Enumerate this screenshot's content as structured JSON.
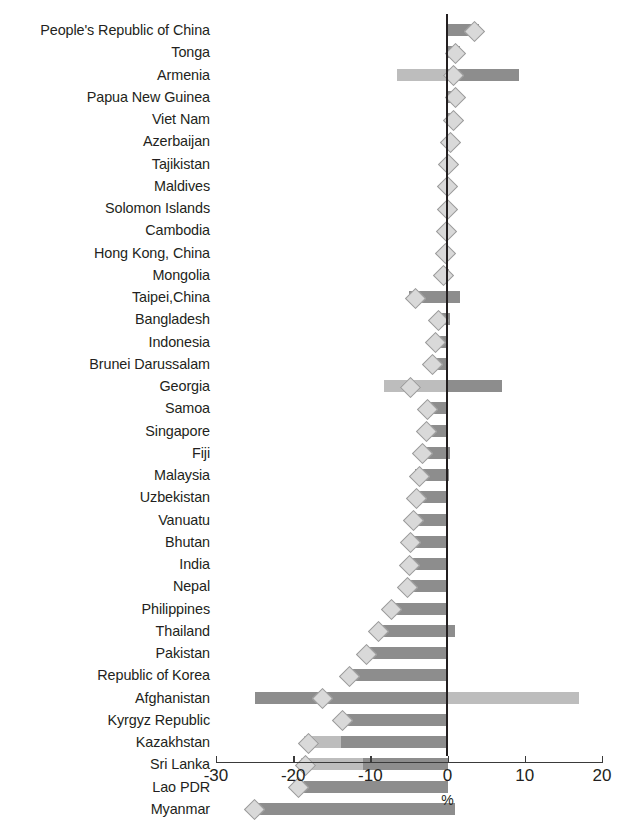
{
  "chart_data": {
    "type": "bar",
    "orientation": "horizontal",
    "title": "",
    "xlabel": "%",
    "ylabel": "",
    "xlim": [
      -30,
      20
    ],
    "xticks": [
      -30,
      -20,
      -10,
      0,
      10,
      20
    ],
    "xtick_labels": [
      "-30",
      "-20",
      "-10",
      "0",
      "10",
      "20"
    ],
    "grid": false,
    "legend_position": "none",
    "colors": {
      "dark_bar": "#8d8d8d",
      "light_bar": "#bdbdbd",
      "marker": "#d9d9d9",
      "axis": "#231f20"
    },
    "categories": [
      "People's Republic of China",
      "Tonga",
      "Armenia",
      "Papua New Guinea",
      "Viet Nam",
      "Azerbaijan",
      "Tajikistan",
      "Maldives",
      "Solomon Islands",
      "Cambodia",
      "Hong Kong, China",
      "Mongolia",
      "Taipei,China",
      "Bangladesh",
      "Indonesia",
      "Brunei Darussalam",
      "Georgia",
      "Samoa",
      "Singapore",
      "Fiji",
      "Malaysia",
      "Uzbekistan",
      "Vanuatu",
      "Bhutan",
      "India",
      "Nepal",
      "Philippines",
      "Thailand",
      "Pakistan",
      "Republic of Korea",
      "Afghanistan",
      "Kyrgyz Republic",
      "Kazakhstan",
      "Sri Lanka",
      "Lao PDR",
      "Myanmar"
    ],
    "series": [
      {
        "name": "Lower range",
        "values": [
          0.0,
          0.0,
          -6.6,
          0.0,
          0.0,
          0.0,
          -0.2,
          -0.3,
          -0.4,
          -0.5,
          -0.6,
          -0.8,
          -5.0,
          -1.6,
          -2.0,
          -2.4,
          -8.2,
          -3.0,
          -3.2,
          -3.8,
          -4.2,
          -4.5,
          -4.8,
          -5.2,
          -5.4,
          -5.6,
          -7.8,
          -9.5,
          -11.0,
          -13.2,
          -25.0,
          -14.2,
          -18.6,
          -19.0,
          -20.0,
          -25.5
        ]
      },
      {
        "name": "Upper range",
        "values": [
          4.1,
          1.6,
          9.2,
          1.5,
          1.2,
          0.6,
          0.4,
          0.3,
          0.2,
          0.2,
          0.2,
          0.2,
          1.6,
          0.3,
          0.0,
          0.0,
          7.0,
          0.0,
          0.0,
          0.3,
          0.2,
          0.0,
          0.0,
          0.0,
          0.0,
          0.0,
          0.0,
          0.9,
          0.0,
          0.0,
          17.0,
          0.0,
          0.0,
          0.0,
          0.0,
          1.0
        ]
      }
    ],
    "markers": {
      "name": "Central estimate",
      "values": [
        3.3,
        0.9,
        0.6,
        0.9,
        0.6,
        0.2,
        0.0,
        -0.1,
        -0.2,
        -0.3,
        -0.4,
        -0.6,
        -4.3,
        -1.3,
        -1.7,
        -2.1,
        -4.9,
        -2.7,
        -2.9,
        -3.4,
        -3.8,
        -4.2,
        -4.5,
        -4.9,
        -5.1,
        -5.3,
        -7.4,
        -9.1,
        -10.6,
        -12.8,
        -16.3,
        -13.8,
        -18.2,
        -18.6,
        -19.5,
        -25.1
      ]
    },
    "splits": [
      0.0,
      0.0,
      0.0,
      0.0,
      0.0,
      0.0,
      0.0,
      0.0,
      0.0,
      0.0,
      0.0,
      0.0,
      0.0,
      0.0,
      0.0,
      0.0,
      0.0,
      0.0,
      0.0,
      0.0,
      0.0,
      0.0,
      0.0,
      0.0,
      0.0,
      0.0,
      0.0,
      0.0,
      0.0,
      0.0,
      0.0,
      0.0,
      -13.8,
      -11.0,
      -18.6,
      0.0
    ]
  }
}
